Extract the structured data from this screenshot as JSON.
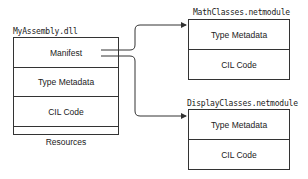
{
  "assembly": {
    "title": "MyAssembly.dll",
    "rows": [
      "Manifest",
      "Type Metadata",
      "CIL Code",
      "Resources"
    ]
  },
  "modules": [
    {
      "title": "MathClasses.netmodule",
      "rows": [
        "Type Metadata",
        "CIL Code"
      ]
    },
    {
      "title": "DisplayClasses.netmodule",
      "rows": [
        "Type Metadata",
        "CIL Code"
      ]
    }
  ],
  "colors": {
    "line": "#333333",
    "background": "#ffffff"
  }
}
